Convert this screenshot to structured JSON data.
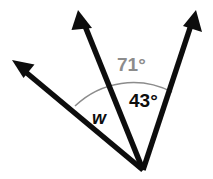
{
  "figure": {
    "background_color": "#ffffff",
    "width": 213,
    "height": 179
  },
  "geometry": {
    "vertex": {
      "x": 143,
      "y": 170
    },
    "rays": [
      {
        "name": "left-ray",
        "tip": {
          "x": 12,
          "y": 60
        },
        "color": "#0d0d0d",
        "thickness": 5,
        "arrowhead": true
      },
      {
        "name": "middle-ray",
        "tip": {
          "x": 78,
          "y": 10
        },
        "color": "#0d0d0d",
        "thickness": 5,
        "arrowhead": true
      },
      {
        "name": "right-ray",
        "tip": {
          "x": 196,
          "y": 10
        },
        "color": "#0d0d0d",
        "thickness": 5,
        "arrowhead": true
      }
    ],
    "arcs": [
      {
        "name": "outer-arc-71",
        "color": "#8c8c8c",
        "thickness": 1.4,
        "radius": 84,
        "from_ray": "middle-ray",
        "to_ray": "right-ray"
      },
      {
        "name": "inner-arc-w",
        "color": "#8c8c8c",
        "thickness": 1.4,
        "radius": 76,
        "from_ray": "left-ray",
        "to_ray": "middle-ray"
      }
    ]
  },
  "labels": {
    "angle_71": {
      "text": "71°",
      "value": 71,
      "unit": "degrees",
      "color": "#8c8c8c"
    },
    "angle_43": {
      "text": "43°",
      "value": 43,
      "unit": "degrees",
      "color": "#0d0d0d"
    },
    "angle_w": {
      "text": "w",
      "value": null,
      "unit": "degrees",
      "color": "#0d0d0d"
    }
  }
}
